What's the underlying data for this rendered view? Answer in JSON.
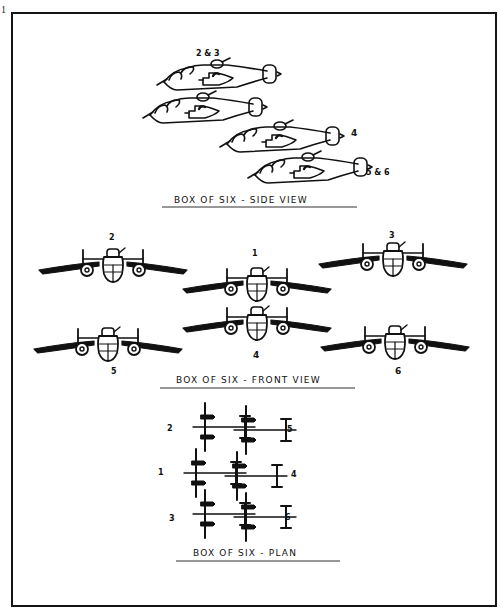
{
  "page": {
    "page_number": "1",
    "border_color": "#151515",
    "ink_color": "#111111",
    "background": "#ffffff"
  },
  "side_view": {
    "caption": "BOX OF SIX  -  SIDE VIEW",
    "labels": [
      "2 & 3",
      "4",
      "5 & 6"
    ],
    "aircraft": [
      {
        "id": "2&3-lead",
        "x": 155,
        "y": 60
      },
      {
        "id": "2&3-trail",
        "x": 143,
        "y": 93
      },
      {
        "id": "4",
        "x": 220,
        "y": 120
      },
      {
        "id": "5&6",
        "x": 247,
        "y": 151
      }
    ]
  },
  "front_view": {
    "caption": "BOX OF SIX  -  FRONT VIEW",
    "aircraft": [
      {
        "label": "2",
        "cx": 113,
        "cy": 268,
        "label_pos": "above"
      },
      {
        "label": "1",
        "cx": 257,
        "cy": 287,
        "label_pos": "above"
      },
      {
        "label": "3",
        "cx": 393,
        "cy": 262,
        "label_pos": "above"
      },
      {
        "label": "5",
        "cx": 108,
        "cy": 347,
        "label_pos": "below"
      },
      {
        "label": "4",
        "cx": 257,
        "cy": 326,
        "label_pos": "below"
      },
      {
        "label": "6",
        "cx": 395,
        "cy": 345,
        "label_pos": "below"
      }
    ]
  },
  "plan_view": {
    "caption": "BOX OF SIX  -  PLAN",
    "aircraft": [
      {
        "label": "2",
        "wing_x": 205,
        "fus_y": 427,
        "side": "left"
      },
      {
        "label": "1",
        "wing_x": 196,
        "fus_y": 473,
        "side": "left"
      },
      {
        "label": "3",
        "wing_x": 205,
        "fus_y": 514,
        "side": "left"
      },
      {
        "label": "5",
        "wing_x": 246,
        "fus_y": 430,
        "side": "right"
      },
      {
        "label": "4",
        "wing_x": 236,
        "fus_y": 475,
        "side": "right"
      },
      {
        "label": "6",
        "wing_x": 246,
        "fus_y": 517,
        "side": "right"
      }
    ]
  }
}
